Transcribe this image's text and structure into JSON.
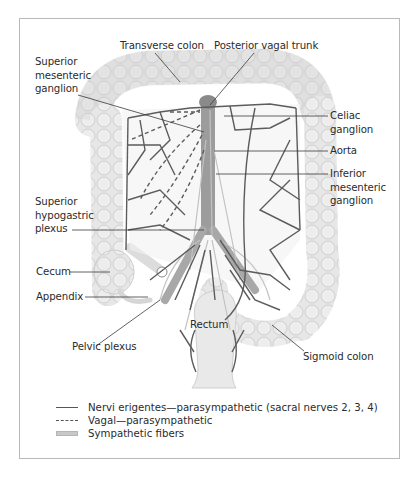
{
  "diagram": {
    "labels": {
      "transverse_colon": "Transverse colon",
      "posterior_vagal_trunk": "Posterior vagal trunk",
      "superior_mesenteric_ganglion": "Superior\nmesenteric\nganglion",
      "celiac_ganglion": "Celiac\nganglion",
      "aorta": "Aorta",
      "inferior_mesenteric_ganglion": "Inferior\nmesenteric\nganglion",
      "superior_hypogastric_plexus": "Superior\nhypogastric\nplexus",
      "cecum": "Cecum",
      "appendix": "Appendix",
      "rectum": "Rectum",
      "pelvic_plexus": "Pelvic plexus",
      "sigmoid_colon": "Sigmoid colon"
    },
    "legend": [
      {
        "style": "solid",
        "label": "Nervi erigentes—parasympathetic (sacral nerves 2, 3, 4)"
      },
      {
        "style": "dashed",
        "label": "Vagal—parasympathetic"
      },
      {
        "style": "band",
        "label": "Sympathetic fibers"
      }
    ],
    "colors": {
      "colon_fill": "#e6e6e6",
      "colon_outline": "#c4c4c4",
      "nerve": "#5a5a5a",
      "sympathetic": "#b8b8b8",
      "frame": "#b9b9b9"
    }
  }
}
